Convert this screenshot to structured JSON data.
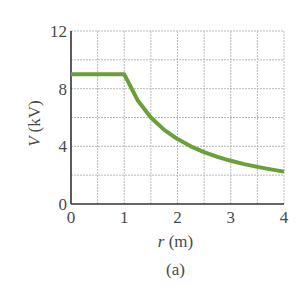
{
  "chart_data": {
    "type": "line",
    "title": "",
    "caption": "(a)",
    "xlabel": "r (m)",
    "xlabel_var": "r",
    "xlabel_unit": "(m)",
    "ylabel": "V (kV)",
    "ylabel_var": "V",
    "ylabel_unit": "(kV)",
    "xlim": [
      0,
      4
    ],
    "ylim": [
      0,
      12
    ],
    "xticks": [
      0,
      1,
      2,
      3,
      4
    ],
    "yticks": [
      0,
      4,
      8,
      12
    ],
    "grid": true,
    "grid_step_x": 0.5,
    "grid_step_y": 2,
    "line_color": "#6a9f3a",
    "series": [
      {
        "name": "V(r)",
        "x": [
          0,
          0.5,
          1.0,
          1.25,
          1.5,
          1.75,
          2.0,
          2.25,
          2.5,
          2.75,
          3.0,
          3.25,
          3.5,
          3.75,
          4.0
        ],
        "values": [
          9.0,
          9.0,
          9.0,
          7.2,
          6.0,
          5.14,
          4.5,
          4.0,
          3.6,
          3.27,
          3.0,
          2.77,
          2.57,
          2.4,
          2.25
        ]
      }
    ]
  }
}
